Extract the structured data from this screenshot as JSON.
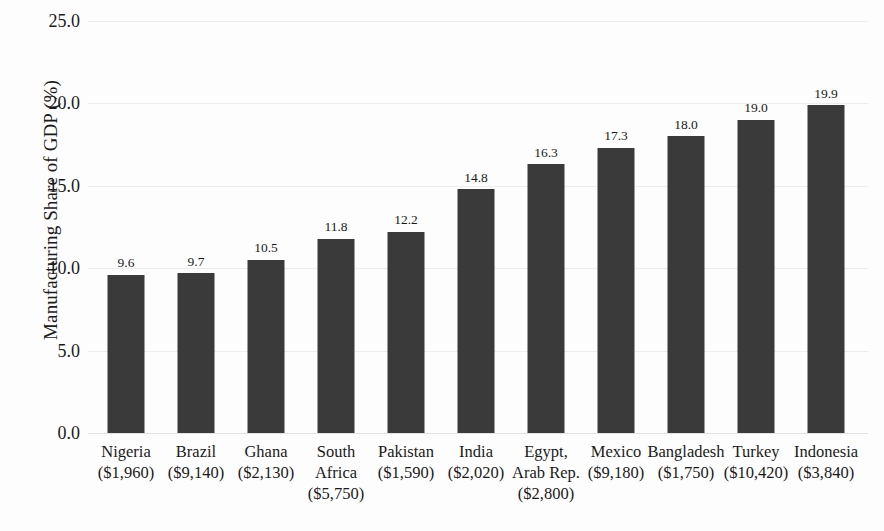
{
  "chart_data": {
    "type": "bar",
    "title": "",
    "xlabel": "",
    "ylabel": "Manufacturing Share of GDP (%)",
    "ylim": [
      0.0,
      25.0
    ],
    "ytick_labels": [
      "0.0",
      "5.0",
      "10.0",
      "15.0",
      "20.0",
      "25.0"
    ],
    "yticks": [
      0.0,
      5.0,
      10.0,
      15.0,
      20.0,
      25.0
    ],
    "grid": true,
    "legend": "none",
    "bar_color": "#3a3a3a",
    "categories": [
      "Nigeria ($1,960)",
      "Brazil ($9,140)",
      "Ghana ($2,130)",
      "South Africa ($5,750)",
      "Pakistan ($1,590)",
      "India ($2,020)",
      "Egypt, Arab Rep. ($2,800)",
      "Mexico ($9,180)",
      "Bangladesh ($1,750)",
      "Turkey ($10,420)",
      "Indonesia ($3,840)"
    ],
    "values": [
      9.6,
      9.7,
      10.5,
      11.8,
      12.2,
      14.8,
      16.3,
      17.3,
      18.0,
      19.0,
      19.9
    ],
    "bars": [
      {
        "label_lines": [
          "Nigeria",
          "($1,960)"
        ],
        "country": "Nigeria",
        "gdp_per_capita": "($1,960)",
        "value": 9.6,
        "value_label": "9.6"
      },
      {
        "label_lines": [
          "Brazil",
          "($9,140)"
        ],
        "country": "Brazil",
        "gdp_per_capita": "($9,140)",
        "value": 9.7,
        "value_label": "9.7"
      },
      {
        "label_lines": [
          "Ghana",
          "($2,130)"
        ],
        "country": "Ghana",
        "gdp_per_capita": "($2,130)",
        "value": 10.5,
        "value_label": "10.5"
      },
      {
        "label_lines": [
          "South",
          "Africa",
          "($5,750)"
        ],
        "country": "South Africa",
        "gdp_per_capita": "($5,750)",
        "value": 11.8,
        "value_label": "11.8"
      },
      {
        "label_lines": [
          "Pakistan",
          "($1,590)"
        ],
        "country": "Pakistan",
        "gdp_per_capita": "($1,590)",
        "value": 12.2,
        "value_label": "12.2"
      },
      {
        "label_lines": [
          "India",
          "($2,020)"
        ],
        "country": "India",
        "gdp_per_capita": "($2,020)",
        "value": 14.8,
        "value_label": "14.8"
      },
      {
        "label_lines": [
          "Egypt,",
          "Arab Rep.",
          "($2,800)"
        ],
        "country": "Egypt, Arab Rep.",
        "gdp_per_capita": "($2,800)",
        "value": 16.3,
        "value_label": "16.3"
      },
      {
        "label_lines": [
          "Mexico",
          "($9,180)"
        ],
        "country": "Mexico",
        "gdp_per_capita": "($9,180)",
        "value": 17.3,
        "value_label": "17.3"
      },
      {
        "label_lines": [
          "Bangladesh",
          "($1,750)"
        ],
        "country": "Bangladesh",
        "gdp_per_capita": "($1,750)",
        "value": 18.0,
        "value_label": "18.0"
      },
      {
        "label_lines": [
          "Turkey",
          "($10,420)"
        ],
        "country": "Turkey",
        "gdp_per_capita": "($10,420)",
        "value": 19.0,
        "value_label": "19.0"
      },
      {
        "label_lines": [
          "Indonesia",
          "($3,840)"
        ],
        "country": "Indonesia",
        "gdp_per_capita": "($3,840)",
        "value": 19.9,
        "value_label": "19.9"
      }
    ]
  }
}
